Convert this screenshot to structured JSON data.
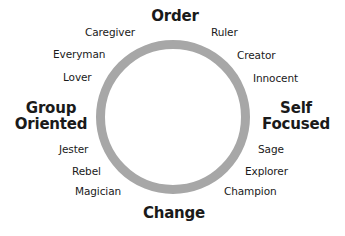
{
  "diagram": {
    "type": "circular-archetype-wheel",
    "ring_color": "#a7a7a7",
    "axes": {
      "top": "Order",
      "bottom": "Change",
      "left": [
        "Group",
        "Oriented"
      ],
      "right": [
        "Self",
        "Focused"
      ]
    },
    "archetypes": {
      "upper_left": [
        "Caregiver",
        "Everyman",
        "Lover"
      ],
      "upper_right": [
        "Ruler",
        "Creator",
        "Innocent"
      ],
      "lower_left": [
        "Jester",
        "Rebel",
        "Magician"
      ],
      "lower_right": [
        "Sage",
        "Explorer",
        "Champion"
      ]
    }
  }
}
